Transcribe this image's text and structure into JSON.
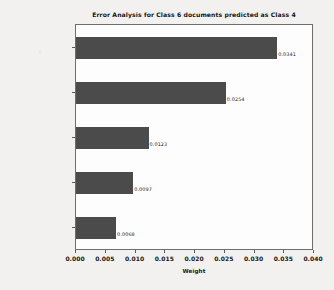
{
  "chart_data": {
    "type": "bar",
    "orientation": "horizontal",
    "title": "Error Analysis for Class 6 documents predicted as Class 4",
    "xlabel": "Weight",
    "ylabel": "",
    "categories": [
      "{'icon'}",
      "{'accessing'}",
      "{'engineers'}",
      "{'attached'}",
      "{'logging', 'log'}"
    ],
    "values": [
      0.0341,
      0.0254,
      0.0123,
      0.0097,
      0.0068
    ],
    "value_labels": [
      "0.0341",
      "0.0254",
      "0.0123",
      "0.0097",
      "0.0068"
    ],
    "xlim": [
      0.0,
      0.04
    ],
    "xticks": [
      0.0,
      0.005,
      0.01,
      0.015,
      0.02,
      0.025,
      0.03,
      0.035,
      0.04
    ],
    "xtick_labels": [
      "0.000",
      "0.005",
      "0.010",
      "0.015",
      "0.020",
      "0.025",
      "0.030",
      "0.035",
      "0.040"
    ],
    "grid": false,
    "legend": null,
    "bar_color": "#4b4b4b",
    "plot_background": "#fdfdfd",
    "page_background": "#f2f1ef",
    "axis_color": "#6e6e6e",
    "text_color": "#161616"
  }
}
